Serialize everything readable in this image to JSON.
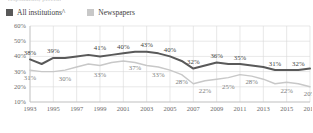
{
  "clipped_title": "respondents, percent",
  "legend": {
    "items": [
      {
        "label": "All institutions^",
        "color": "#595959",
        "name": "all-institutions"
      },
      {
        "label": "Newspapers",
        "color": "#c8c8c8",
        "name": "newspapers"
      }
    ]
  },
  "axes": {
    "y_ticks": [
      "60%",
      "50%",
      "40%",
      "30%",
      "20%",
      "10%"
    ],
    "x_ticks": [
      "1993",
      "1995",
      "1997",
      "1999",
      "2001",
      "2003",
      "2005",
      "2007",
      "2009",
      "2011",
      "2013",
      "2015",
      "2017"
    ]
  },
  "chart_data": {
    "type": "line",
    "title": "",
    "xlabel": "",
    "ylabel": "",
    "ylim": [
      10,
      60
    ],
    "xlim": [
      1993,
      2017
    ],
    "grid": true,
    "legend_position": "top-left",
    "x": [
      1993,
      1994,
      1995,
      1996,
      1997,
      1998,
      1999,
      2000,
      2001,
      2002,
      2003,
      2004,
      2005,
      2006,
      2007,
      2008,
      2009,
      2010,
      2011,
      2012,
      2013,
      2014,
      2015,
      2016,
      2017
    ],
    "series": [
      {
        "name": "All institutions^",
        "color": "#595959",
        "values": [
          38,
          35,
          39,
          39,
          40,
          41,
          40,
          41,
          42,
          43,
          43,
          42,
          40,
          37,
          32,
          34,
          36,
          35,
          35,
          34,
          33,
          31,
          31,
          31,
          32
        ],
        "labels": [
          {
            "x": 1993,
            "value": 38,
            "text": "38%"
          },
          {
            "x": 1995,
            "value": 39,
            "text": "39%"
          },
          {
            "x": 1999,
            "value": 41,
            "text": "41%"
          },
          {
            "x": 2001,
            "value": 42,
            "text": "40%"
          },
          {
            "x": 2003,
            "value": 43,
            "text": "43%"
          },
          {
            "x": 2005,
            "value": 40,
            "text": "40%"
          },
          {
            "x": 2007,
            "value": 32,
            "text": "32%"
          },
          {
            "x": 2009,
            "value": 36,
            "text": "36%"
          },
          {
            "x": 2011,
            "value": 35,
            "text": "35%"
          },
          {
            "x": 2014,
            "value": 31,
            "text": "31%"
          },
          {
            "x": 2016,
            "value": 31,
            "text": "32%"
          }
        ]
      },
      {
        "name": "Newspapers",
        "color": "#c8c8c8",
        "values": [
          31,
          30,
          30,
          31,
          33,
          35,
          34,
          36,
          37,
          36,
          34,
          33,
          31,
          28,
          22,
          24,
          25,
          26,
          28,
          27,
          25,
          22,
          23,
          22,
          20
        ],
        "labels": [
          {
            "x": 1993,
            "value": 31,
            "text": "31%"
          },
          {
            "x": 1996,
            "value": 30,
            "text": "30%"
          },
          {
            "x": 1999,
            "value": 33,
            "text": "33%"
          },
          {
            "x": 2002,
            "value": 37,
            "text": "37%"
          },
          {
            "x": 2004,
            "value": 33,
            "text": "33%"
          },
          {
            "x": 2006,
            "value": 28,
            "text": "28%"
          },
          {
            "x": 2008,
            "value": 22,
            "text": "22%"
          },
          {
            "x": 2010,
            "value": 25,
            "text": "25%"
          },
          {
            "x": 2012,
            "value": 28,
            "text": "28%"
          },
          {
            "x": 2015,
            "value": 22,
            "text": "22%"
          },
          {
            "x": 2017,
            "value": 20,
            "text": "20%"
          }
        ]
      }
    ]
  }
}
